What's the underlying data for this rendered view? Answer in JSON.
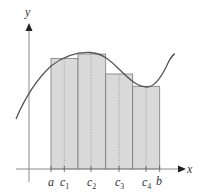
{
  "figure": {
    "type": "riemann-sum-diagram",
    "axes": {
      "x_label": "x",
      "y_label": "y"
    },
    "tick_labels": [
      {
        "id": "a",
        "text": "a",
        "sub": ""
      },
      {
        "id": "c1",
        "text": "c",
        "sub": "1"
      },
      {
        "id": "c2",
        "text": "c",
        "sub": "2"
      },
      {
        "id": "c3",
        "text": "c",
        "sub": "3"
      },
      {
        "id": "c4",
        "text": "c",
        "sub": "4"
      },
      {
        "id": "b",
        "text": "b",
        "sub": ""
      }
    ],
    "rectangles": [
      {
        "index": 1,
        "sample_point": "c1"
      },
      {
        "index": 2,
        "sample_point": "c2"
      },
      {
        "index": 3,
        "sample_point": "c3"
      },
      {
        "index": 4,
        "sample_point": "c4"
      }
    ],
    "colors": {
      "rect_fill": "#d9d9d9",
      "rect_stroke": "#7a7a7a",
      "curve": "#555555",
      "axis": "#8a8a8a",
      "arrow": "#222222"
    }
  }
}
